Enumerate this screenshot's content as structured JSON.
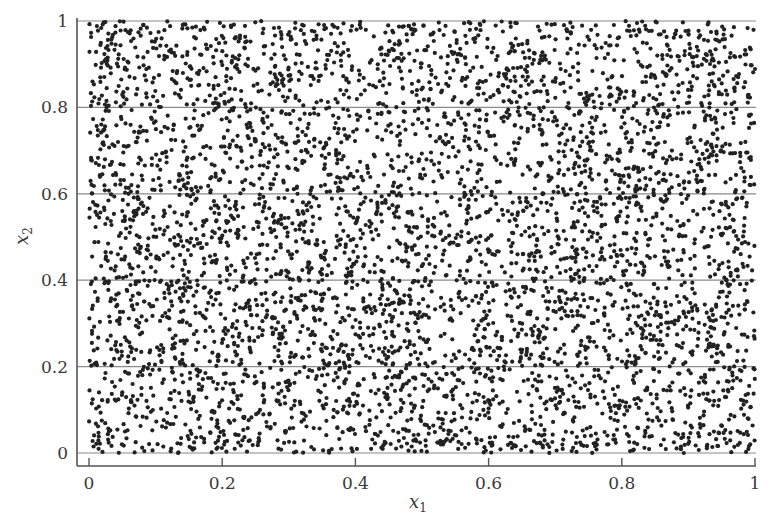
{
  "chart_data": {
    "type": "scatter",
    "title": "",
    "xlabel": "x1",
    "ylabel": "x2",
    "xlim": [
      0,
      1
    ],
    "ylim": [
      0,
      1
    ],
    "xticks": [
      "0",
      "0.2",
      "0.4",
      "0.6",
      "0.8",
      "1"
    ],
    "yticks": [
      "0",
      "0.2",
      "0.4",
      "0.6",
      "0.8",
      "1"
    ],
    "grid": {
      "horizontal": true,
      "vertical": false,
      "levels": [
        0,
        0.2,
        0.4,
        0.6,
        0.8,
        1
      ]
    },
    "legend": null,
    "series": [
      {
        "name": "uniform random points",
        "distribution": "uniform over [0,1] x [0,1]",
        "approx_count": 5000,
        "marker": "filled circle",
        "color": "#222222"
      }
    ]
  },
  "axes": {
    "x_label_main": "x",
    "x_label_sub": "1",
    "y_label_main": "x",
    "y_label_sub": "2"
  },
  "colors": {
    "point": "#222222",
    "grid": "#8a8a8a",
    "axis": "#555555"
  }
}
